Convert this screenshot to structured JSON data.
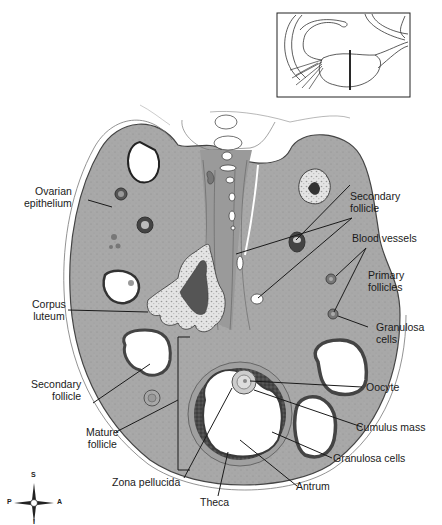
{
  "figure": {
    "inset": {
      "description": "Ovary with uterine tube; vertical line marks plane of section"
    },
    "tissue_color": "#a9a9a9",
    "line_color": "#1a1a1a"
  },
  "labels": {
    "ovarian_epithelium": {
      "line1": "Ovarian",
      "line2": "epithelium"
    },
    "corpus_luteum": {
      "line1": "Corpus",
      "line2": "luteum"
    },
    "secondary_follicle_left": {
      "line1": "Secondary",
      "line2": "follicle"
    },
    "mature_follicle": {
      "line1": "Mature",
      "line2": "follicle"
    },
    "zona_pellucida": {
      "line1": "Zona pellucida"
    },
    "theca": {
      "line1": "Theca"
    },
    "antrum": {
      "line1": "Antrum"
    },
    "granulosa_cells_bottom": {
      "line1": "Granulosa cells"
    },
    "cumulus_mass": {
      "line1": "Cumulus mass"
    },
    "oocyte": {
      "line1": "Oocyte"
    },
    "granulosa_cells_right": {
      "line1": "Granulosa",
      "line2": "cells"
    },
    "primary_follicles": {
      "line1": "Primary",
      "line2": "follicles"
    },
    "blood_vessels": {
      "line1": "Blood vessels"
    },
    "secondary_follicle_right": {
      "line1": "Secondary",
      "line2": "follicle"
    }
  },
  "compass": {
    "superior": "S",
    "inferior": "I",
    "posterior": "P",
    "anterior": "A"
  }
}
